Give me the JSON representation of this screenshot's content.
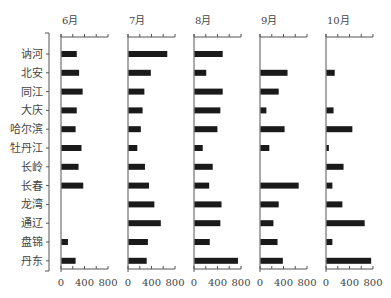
{
  "chart_data": {
    "type": "bar",
    "orientation": "horizontal",
    "layout": "small-multiples",
    "title": "",
    "xlabel": "",
    "ylabel": "",
    "xlim": [
      0,
      800
    ],
    "xticks": [
      0,
      400,
      800
    ],
    "xtick_labels": [
      "0",
      "400",
      "800"
    ],
    "grid": false,
    "legend": "none",
    "categories": [
      "讷河",
      "北安",
      "同江",
      "大庆",
      "哈尔滨",
      "牡丹江",
      "长岭",
      "长春",
      "龙湾",
      "通辽",
      "盘锦",
      "丹东"
    ],
    "series": [
      {
        "name": "6月",
        "values": [
          260,
          300,
          360,
          260,
          240,
          340,
          290,
          370,
          null,
          null,
          110,
          240
        ]
      },
      {
        "name": "7月",
        "values": [
          660,
          380,
          270,
          240,
          210,
          150,
          280,
          350,
          440,
          550,
          330,
          310
        ]
      },
      {
        "name": "8月",
        "values": [
          480,
          200,
          480,
          440,
          390,
          140,
          310,
          250,
          460,
          440,
          260,
          740
        ]
      },
      {
        "name": "9月",
        "values": [
          null,
          460,
          310,
          100,
          410,
          150,
          null,
          650,
          310,
          220,
          290,
          380
        ]
      },
      {
        "name": "10月",
        "values": [
          null,
          140,
          null,
          120,
          440,
          40,
          290,
          100,
          270,
          650,
          100,
          760
        ]
      }
    ]
  },
  "colors": {
    "bar": "#1a1a1a",
    "axis": "#555555",
    "text": "#444444"
  }
}
